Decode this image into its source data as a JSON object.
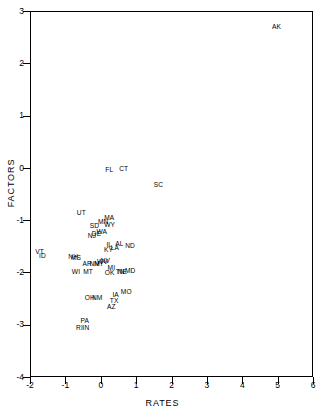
{
  "chart_data": {
    "type": "scatter",
    "title": "",
    "xlabel": "RATES",
    "ylabel": "FACTORS",
    "xlim": [
      -2,
      6
    ],
    "ylim": [
      -4,
      3
    ],
    "xticks": [
      -2,
      -1,
      0,
      1,
      2,
      3,
      4,
      5,
      6
    ],
    "yticks": [
      -4,
      -3,
      -2,
      -1,
      0,
      1,
      2,
      3
    ],
    "xtick_labels": [
      "-2",
      "-1",
      "0",
      "1",
      "2",
      "3",
      "4",
      "5",
      "6"
    ],
    "ytick_labels": [
      "-4",
      "-3",
      "-2",
      "-1",
      "0",
      "1",
      "2",
      "3"
    ],
    "grid": false,
    "legend": null,
    "marker_style": "text-label",
    "note": "Each data point is drawn as its two-letter state abbreviation.",
    "points": [
      {
        "label": "AK",
        "x": 4.97,
        "y": 2.69
      },
      {
        "label": "FL",
        "x": 0.24,
        "y": -0.04
      },
      {
        "label": "CT",
        "x": 0.65,
        "y": -0.02
      },
      {
        "label": "SC",
        "x": 1.63,
        "y": -0.32
      },
      {
        "label": "UT",
        "x": -0.55,
        "y": -0.86
      },
      {
        "label": "MA",
        "x": 0.24,
        "y": -0.95
      },
      {
        "label": "MN",
        "x": 0.07,
        "y": -1.03
      },
      {
        "label": "WY",
        "x": 0.25,
        "y": -1.09
      },
      {
        "label": "SD",
        "x": -0.18,
        "y": -1.11
      },
      {
        "label": "WA",
        "x": 0.03,
        "y": -1.23
      },
      {
        "label": "DE",
        "x": -0.12,
        "y": -1.27
      },
      {
        "label": "NJ",
        "x": -0.25,
        "y": -1.3
      },
      {
        "label": "AL",
        "x": 0.53,
        "y": -1.46
      },
      {
        "label": "ND",
        "x": 0.83,
        "y": -1.49
      },
      {
        "label": "IL",
        "x": 0.24,
        "y": -1.47
      },
      {
        "label": "LA",
        "x": 0.4,
        "y": -1.53
      },
      {
        "label": "KY",
        "x": 0.22,
        "y": -1.57
      },
      {
        "label": "VT",
        "x": -1.73,
        "y": -1.6
      },
      {
        "label": "ID",
        "x": -1.65,
        "y": -1.69
      },
      {
        "label": "NH",
        "x": -0.78,
        "y": -1.7
      },
      {
        "label": "MS",
        "x": -0.7,
        "y": -1.72
      },
      {
        "label": "NV",
        "x": 0.13,
        "y": -1.78
      },
      {
        "label": "WV",
        "x": 0.05,
        "y": -1.81
      },
      {
        "label": "NY",
        "x": -0.05,
        "y": -1.83
      },
      {
        "label": "NM",
        "x": -0.17,
        "y": -1.84
      },
      {
        "label": "AR",
        "x": -0.38,
        "y": -1.84
      },
      {
        "label": "MI",
        "x": 0.3,
        "y": -1.92
      },
      {
        "label": "MD",
        "x": 0.83,
        "y": -1.97
      },
      {
        "label": "TN",
        "x": 0.55,
        "y": -2.0
      },
      {
        "label": "NE",
        "x": 0.61,
        "y": -2.0
      },
      {
        "label": "OK",
        "x": 0.25,
        "y": -2.02
      },
      {
        "label": "MT",
        "x": -0.36,
        "y": -2.0
      },
      {
        "label": "WI",
        "x": -0.7,
        "y": -2.0
      },
      {
        "label": "MO",
        "x": 0.72,
        "y": -2.38
      },
      {
        "label": "IA",
        "x": 0.42,
        "y": -2.43
      },
      {
        "label": "NM2",
        "x": -0.1,
        "y": -2.48
      },
      {
        "label": "OH",
        "x": -0.31,
        "y": -2.49
      },
      {
        "label": "TX",
        "x": 0.38,
        "y": -2.54
      },
      {
        "label": "AZ",
        "x": 0.3,
        "y": -2.67
      },
      {
        "label": "PA",
        "x": -0.45,
        "y": -2.92
      },
      {
        "label": "RI",
        "x": -0.6,
        "y": -3.07
      },
      {
        "label": "IN",
        "x": -0.42,
        "y": -3.07
      }
    ]
  },
  "axes": {
    "x_title": "RATES",
    "y_title": "FACTORS"
  }
}
